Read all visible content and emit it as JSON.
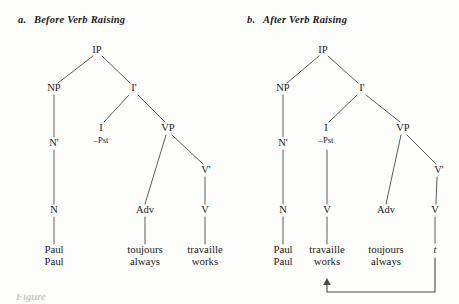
{
  "figure": {
    "background_color": "#fdfdfc",
    "line_color": "#4a4a4a",
    "text_color": "#1a1a1a",
    "width": 459,
    "height": 304
  },
  "panels": [
    {
      "id": "panel-a",
      "letter": "a.",
      "caption": "Before Verb Raising",
      "nodes": {
        "ip": "IP",
        "np": "NP",
        "ibar": "I'",
        "nbar": "N'",
        "infl": "I",
        "infl_feature": "–Pst",
        "vp": "VP",
        "n": "N",
        "adv": "Adv",
        "vbar": "V'",
        "v": "V"
      },
      "terminals": [
        {
          "name": "paul",
          "word": "Paul",
          "gloss": "Paul"
        },
        {
          "name": "toujours",
          "word": "toujours",
          "gloss": "always"
        },
        {
          "name": "travaille",
          "word": "travaille",
          "gloss": "works"
        }
      ]
    },
    {
      "id": "panel-b",
      "letter": "b.",
      "caption": "After Verb Raising",
      "nodes": {
        "ip": "IP",
        "np": "NP",
        "ibar": "I'",
        "nbar": "N'",
        "infl": "I",
        "infl_feature": "–Pst",
        "vp": "VP",
        "n": "N",
        "v_raised": "V",
        "adv": "Adv",
        "vbar": "V'",
        "v": "V"
      },
      "terminals": [
        {
          "name": "paul",
          "word": "Paul",
          "gloss": "Paul"
        },
        {
          "name": "travaille",
          "word": "travaille",
          "gloss": "works"
        },
        {
          "name": "toujours",
          "word": "toujours",
          "gloss": "always"
        },
        {
          "name": "trace",
          "word": "t",
          "gloss": ""
        }
      ],
      "movement_arrow": {
        "from": "trace",
        "to": "travaille"
      }
    }
  ],
  "bottom_cut_text": "Figure"
}
